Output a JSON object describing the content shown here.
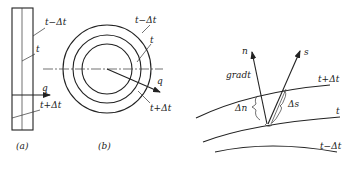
{
  "panel_a": {
    "caption": "(a)",
    "labels": {
      "t_minus": "t−Δt",
      "t": "t",
      "q": "q",
      "t_plus": "t+Δt"
    }
  },
  "panel_b": {
    "caption": "(b)",
    "labels": {
      "t_minus": "t−Δt",
      "t": "t",
      "q": "q",
      "t_plus": "t+Δt"
    }
  },
  "panel_c": {
    "labels": {
      "n": "n",
      "s": "s",
      "grad": "gradt",
      "t_plus": "t+Δt",
      "t": "t",
      "t_minus": "t−Δt",
      "delta_n": "Δn",
      "delta_s": "Δs"
    }
  },
  "colors": {
    "stroke": "#222222",
    "background": "#ffffff"
  }
}
